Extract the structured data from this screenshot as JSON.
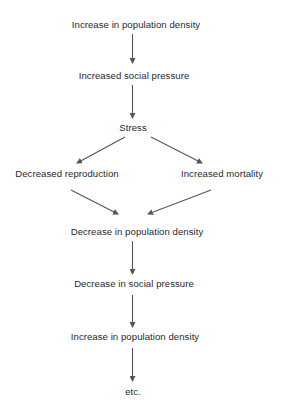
{
  "diagram": {
    "type": "flowchart",
    "nodes": [
      {
        "id": "n1",
        "label": "Increase in population density"
      },
      {
        "id": "n2",
        "label": "Increased social pressure"
      },
      {
        "id": "n3",
        "label": "Stress"
      },
      {
        "id": "n4",
        "label": "Decreased reproduction"
      },
      {
        "id": "n5",
        "label": "Increased mortality"
      },
      {
        "id": "n6",
        "label": "Decrease in population density"
      },
      {
        "id": "n7",
        "label": "Decrease in social pressure"
      },
      {
        "id": "n8",
        "label": "Increase in population density"
      },
      {
        "id": "n9",
        "label": "etc."
      }
    ],
    "edges": [
      {
        "from": "n1",
        "to": "n2"
      },
      {
        "from": "n2",
        "to": "n3"
      },
      {
        "from": "n3",
        "to": "n4"
      },
      {
        "from": "n3",
        "to": "n5"
      },
      {
        "from": "n4",
        "to": "n6"
      },
      {
        "from": "n5",
        "to": "n6"
      },
      {
        "from": "n6",
        "to": "n7"
      },
      {
        "from": "n7",
        "to": "n8"
      },
      {
        "from": "n8",
        "to": "n9"
      }
    ],
    "colors": {
      "text": "#2a2a2a",
      "arrow": "#555555",
      "background": "#ffffff"
    }
  }
}
